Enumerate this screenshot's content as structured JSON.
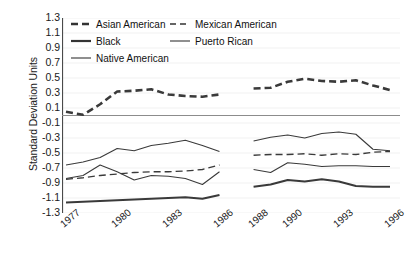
{
  "chart_data": {
    "type": "line",
    "title": "",
    "xlabel": "",
    "ylabel": "Standard Deviation Units",
    "ylim": [
      -1.3,
      1.3
    ],
    "ytick_labels": [
      "1.3",
      "1.1",
      "0.9",
      "0.7",
      "0.5",
      "0.3",
      "0.1",
      "-0.1",
      "-0.3",
      "-0.5",
      "-0.7",
      "-0.9",
      "-1.1",
      "-1.3"
    ],
    "ytick_values": [
      1.3,
      1.1,
      0.9,
      0.7,
      0.5,
      0.3,
      0.1,
      -0.1,
      -0.3,
      -0.5,
      -0.7,
      -0.9,
      -1.1,
      -1.3
    ],
    "x": [
      1977,
      1978,
      1979,
      1980,
      1981,
      1982,
      1983,
      1984,
      1985,
      1986,
      1988,
      1989,
      1990,
      1991,
      1992,
      1993,
      1994,
      1995,
      1996
    ],
    "xtick_labels": [
      "1977",
      "1980",
      "1983",
      "1986",
      "1988",
      "1990",
      "1993",
      "1996"
    ],
    "xtick_label_values": [
      1977,
      1980,
      1983,
      1986,
      1988,
      1990,
      1993,
      1996
    ],
    "gap_note": "No data for 1987",
    "grid": false,
    "zero_line": true,
    "legend_position": "top-left",
    "series": [
      {
        "name": "Asian American",
        "style": "thick-dashed",
        "color": "#3a3a3a",
        "values": [
          0.05,
          0.01,
          0.15,
          0.32,
          0.33,
          0.35,
          0.28,
          0.26,
          0.25,
          0.28,
          0.36,
          0.37,
          0.45,
          0.49,
          0.46,
          0.45,
          0.47,
          0.4,
          0.34
        ]
      },
      {
        "name": "Black",
        "style": "thick-solid",
        "color": "#3a3a3a",
        "values": [
          -1.16,
          -1.15,
          -1.14,
          -1.13,
          -1.12,
          -1.11,
          -1.1,
          -1.09,
          -1.11,
          -1.06,
          -0.95,
          -0.92,
          -0.86,
          -0.88,
          -0.85,
          -0.88,
          -0.94,
          -0.95,
          -0.95
        ]
      },
      {
        "name": "Native American",
        "style": "thin-solid",
        "color": "#3a3a3a",
        "values": [
          -0.84,
          -0.8,
          -0.66,
          -0.75,
          -0.86,
          -0.8,
          -0.81,
          -0.84,
          -0.92,
          -0.75,
          -0.72,
          -0.76,
          -0.63,
          -0.65,
          -0.68,
          -0.67,
          -0.67,
          -0.68,
          -0.68
        ]
      },
      {
        "name": "Mexican American",
        "style": "thin-dashed",
        "color": "#3a3a3a",
        "values": [
          -0.85,
          -0.83,
          -0.8,
          -0.78,
          -0.76,
          -0.75,
          -0.75,
          -0.74,
          -0.72,
          -0.66,
          -0.53,
          -0.52,
          -0.52,
          -0.51,
          -0.53,
          -0.51,
          -0.52,
          -0.49,
          -0.48
        ]
      },
      {
        "name": "Puerto Rican",
        "style": "thin-solid",
        "color": "#3a3a3a",
        "values": [
          -0.66,
          -0.62,
          -0.56,
          -0.44,
          -0.47,
          -0.4,
          -0.37,
          -0.33,
          -0.4,
          -0.48,
          -0.34,
          -0.29,
          -0.26,
          -0.3,
          -0.24,
          -0.22,
          -0.25,
          -0.45,
          -0.47
        ]
      }
    ],
    "legend": [
      {
        "label": "Asian American",
        "style": "thick-dashed"
      },
      {
        "label": "Mexican American",
        "style": "thin-dashed"
      },
      {
        "label": "Black",
        "style": "thick-solid"
      },
      {
        "label": "Puerto Rican",
        "style": "thin-solid"
      },
      {
        "label": "Native American",
        "style": "thin-solid"
      }
    ]
  }
}
